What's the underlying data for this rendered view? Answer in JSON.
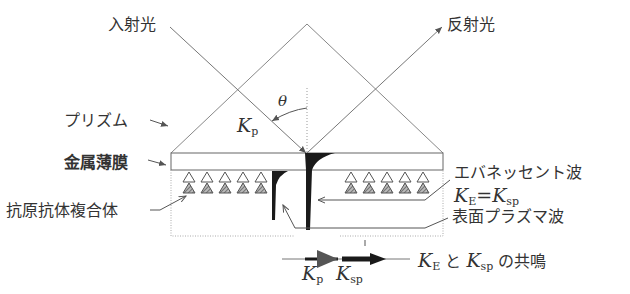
{
  "labels": {
    "incident_light": "入射光",
    "reflected_light": "反射光",
    "prism": "プリズム",
    "metal_film": "金属薄膜",
    "antigen_antibody": "抗原抗体複合体",
    "evanescent_wave": "エバネッセント波",
    "surface_plasmon": "表面プラズマ波",
    "theta": "θ"
  },
  "math": {
    "kp_main": {
      "base": "K",
      "sub": "p"
    },
    "ke_eq_ksp": {
      "left": "K",
      "left_sub": "E",
      "eq": "=",
      "right": "K",
      "right_sub": "sp"
    },
    "bottom_kp": {
      "base": "K",
      "sub": "p"
    },
    "bottom_ksp": {
      "base": "K",
      "sub": "sp"
    },
    "resonance": {
      "a": "K",
      "a_sub": "E",
      "mid": " と ",
      "b": "K",
      "b_sub": "sp",
      "tail": " の共鳴"
    }
  },
  "colors": {
    "line": "#777777",
    "dark": "#1a1a1a",
    "hatch": "#888888"
  }
}
